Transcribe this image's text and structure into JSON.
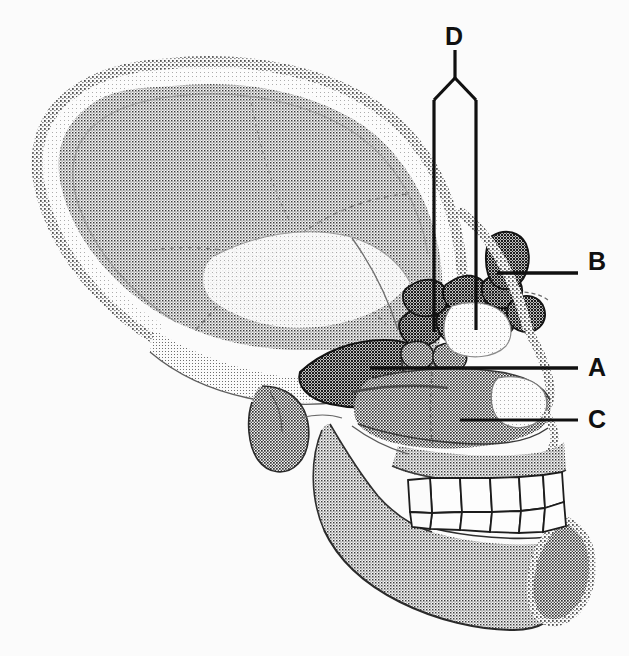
{
  "figure": {
    "kind": "anatomical-illustration",
    "style": "halftone stipple line drawing",
    "background_color": "#fbfbfb",
    "ink_color": "#101010",
    "width": 629,
    "height": 656
  },
  "labels": [
    {
      "id": "A",
      "letter": "A",
      "target": "sphenoid-sinus",
      "letter_x": 588,
      "letter_y": 356,
      "leader": {
        "type": "straight",
        "x1": 370,
        "y1": 368,
        "x2": 578,
        "y2": 368
      }
    },
    {
      "id": "B",
      "letter": "B",
      "target": "frontal-sinus",
      "letter_x": 588,
      "letter_y": 261,
      "leader": {
        "type": "straight",
        "x1": 497,
        "y1": 273,
        "x2": 578,
        "y2": 273
      }
    },
    {
      "id": "C",
      "letter": "C",
      "target": "maxillary-sinus",
      "letter_x": 588,
      "letter_y": 408,
      "leader": {
        "type": "straight",
        "x1": 460,
        "y1": 420,
        "x2": 578,
        "y2": 420
      }
    },
    {
      "id": "D",
      "letter": "D",
      "target": "ethmoid-air-cells",
      "letter_x": 445,
      "letter_y": 26,
      "leader": {
        "type": "forked",
        "stem_x": 455,
        "stem_top": 50,
        "fork_y": 78,
        "left_x": 434,
        "left_bottom": 332,
        "right_x": 476,
        "right_bottom": 330
      }
    }
  ],
  "structures": [
    {
      "name": "cranial-vault",
      "tone": "mid-gray-halftone"
    },
    {
      "name": "diploe-band",
      "tone": "light"
    },
    {
      "name": "outer-table-stipple",
      "tone": "dark-stipple"
    },
    {
      "name": "frontal-sinus",
      "tone": "dark"
    },
    {
      "name": "ethmoid-air-cells",
      "tone": "dark-cluster",
      "count": 9
    },
    {
      "name": "sphenoid-sinus",
      "tone": "dark"
    },
    {
      "name": "maxillary-sinus",
      "tone": "mid-dark"
    },
    {
      "name": "nasal-cavity",
      "tone": "light"
    },
    {
      "name": "maxilla",
      "tone": "mid-gray"
    },
    {
      "name": "mandible",
      "tone": "mid-gray"
    },
    {
      "name": "upper-teeth",
      "count": 6,
      "tone": "white"
    },
    {
      "name": "lower-teeth",
      "count": 6,
      "tone": "white"
    },
    {
      "name": "mastoid-process",
      "tone": "dark"
    },
    {
      "name": "zygomatic-arch",
      "tone": "mid-gray"
    },
    {
      "name": "chin-mentum",
      "tone": "mid-gray"
    }
  ]
}
